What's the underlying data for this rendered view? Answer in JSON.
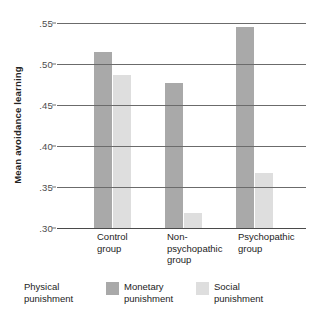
{
  "chart_data": {
    "type": "bar",
    "title": "",
    "subtitle": "",
    "xlabel": "",
    "ylabel": "Mean avoidance learning",
    "ylim": [
      0.3,
      0.55
    ],
    "ytick_labels": [
      ".55",
      ".50",
      ".45",
      ".40",
      ".35",
      ".30"
    ],
    "ytick_values": [
      0.55,
      0.5,
      0.45,
      0.4,
      0.35,
      0.3
    ],
    "grid": true,
    "grid_axis": "y",
    "legend_position": "bottom",
    "categories": [
      "Control group",
      "Non-psychopathic group",
      "Psychopathic group"
    ],
    "category_lines": [
      [
        "Control",
        "group"
      ],
      [
        "Non-",
        "psychopathic",
        "group"
      ],
      [
        "Psychopathic",
        "group"
      ]
    ],
    "series": [
      {
        "name": "Physical punishment",
        "legend_lines": [
          "Physical",
          "punishment"
        ],
        "color": "#ffffff",
        "has_swatch": false,
        "values": [
          null,
          null,
          null
        ]
      },
      {
        "name": "Monetary punishment",
        "legend_lines": [
          "Monetary",
          "punishment"
        ],
        "color": "#a9a9a9",
        "has_swatch": true,
        "values": [
          0.515,
          0.477,
          0.545
        ]
      },
      {
        "name": "Social punishment",
        "legend_lines": [
          "Social",
          "punishment"
        ],
        "color": "#dedede",
        "has_swatch": true,
        "values": [
          0.487,
          0.318,
          0.367
        ]
      }
    ]
  },
  "axis": {
    "label": "Mean avoidance learning"
  },
  "legend": {
    "items": [
      {
        "label": "Physical punishment",
        "line1": "Physical",
        "line2": "punishment"
      },
      {
        "label": "Monetary punishment",
        "line1": "Monetary",
        "line2": "punishment"
      },
      {
        "label": "Social punishment",
        "line1": "Social",
        "line2": "punishment"
      }
    ]
  },
  "xaxis": {
    "labels": [
      {
        "line1": "Control",
        "line2": "group",
        "line3": ""
      },
      {
        "line1": "Non-",
        "line2": "psychopathic",
        "line3": "group"
      },
      {
        "line1": "Psychopathic",
        "line2": "group",
        "line3": ""
      }
    ]
  }
}
